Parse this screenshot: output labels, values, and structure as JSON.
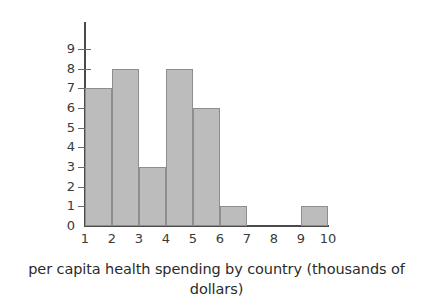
{
  "chart_data": {
    "type": "bar",
    "title": "",
    "subtitle": "",
    "xlabel": "per capita health spending by country (thousands of dollars)",
    "ylabel": "",
    "categories": [
      "1-2",
      "2-3",
      "3-4",
      "4-5",
      "5-6",
      "6-7",
      "7-8",
      "8-9",
      "9-10"
    ],
    "bin_edges": [
      1,
      2,
      3,
      4,
      5,
      6,
      7,
      8,
      9,
      10
    ],
    "values": [
      7,
      8,
      3,
      8,
      6,
      1,
      0,
      0,
      1
    ],
    "xlim": [
      1,
      10
    ],
    "ylim": [
      0,
      9
    ],
    "xticks": [
      "1",
      "2",
      "3",
      "4",
      "5",
      "6",
      "7",
      "8",
      "9",
      "10"
    ],
    "yticks": [
      "0",
      "1",
      "2",
      "3",
      "4",
      "5",
      "6",
      "7",
      "8",
      "9"
    ],
    "grid": false,
    "legend": null,
    "bar_fill_color": "#bcbcbc",
    "bar_edge_color": "#8e8e8e",
    "axis_color": "#4a4a4a",
    "text_color": "#3a3a3a",
    "background_color": "#ffffff"
  },
  "caption": {
    "text": "per capita health spending by country (thousands of dollars)"
  }
}
